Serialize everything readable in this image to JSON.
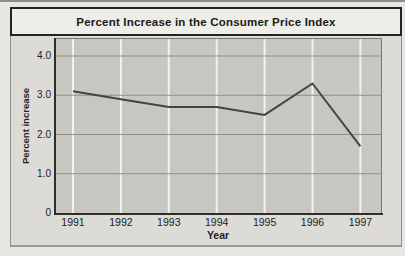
{
  "page": {
    "top_rule_color": "#8d8d8b",
    "background_color": "#e7e6e1"
  },
  "chart_data": {
    "type": "line",
    "title": "Percent Increase in the Consumer Price Index",
    "xlabel": "Year",
    "ylabel": "Percent increase",
    "categories": [
      "1991",
      "1992",
      "1993",
      "1994",
      "1995",
      "1996",
      "1997"
    ],
    "values": [
      3.1,
      2.9,
      2.7,
      2.7,
      2.5,
      3.3,
      1.7
    ],
    "ytick_labels": [
      "4.0",
      "3.0",
      "2.0",
      "1.0",
      "0"
    ],
    "ytick_values": [
      4.0,
      3.0,
      2.0,
      1.0,
      0
    ],
    "ylim": [
      0,
      4.43
    ],
    "grid": {
      "horizontal": true,
      "vertical": true
    },
    "legend_position": "none",
    "colors": {
      "line": "#45443f",
      "plot_background": "#c7c6c1",
      "vertical_gridline": "#f3f2ee",
      "horizontal_gridline": "#908f8b",
      "axis_spine": "#2d2d2a",
      "plot_border_light": "#7a7972",
      "title_bar_background": "#eeede8",
      "chart_background": "#dcdbd6",
      "border": "#242422"
    }
  }
}
